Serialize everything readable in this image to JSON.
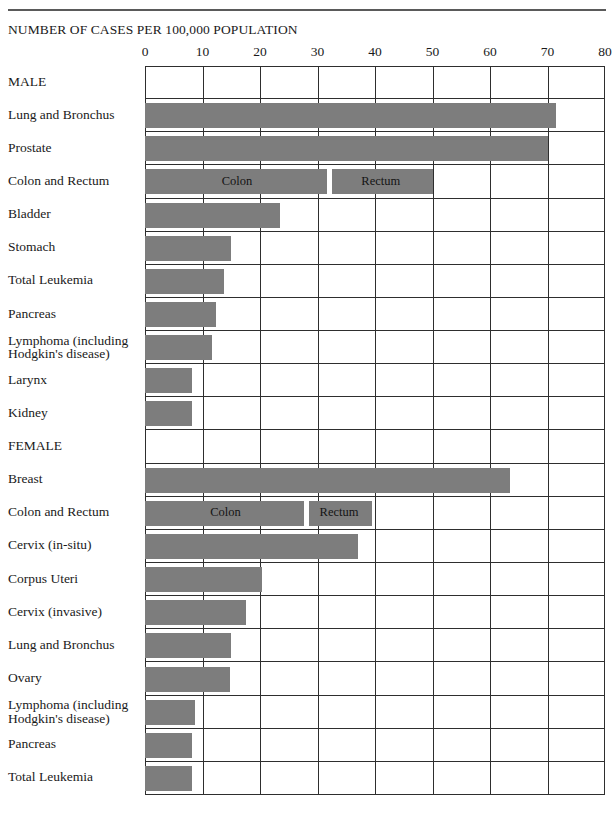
{
  "header": {
    "title": "NUMBER OF CASES PER 100,000 POPULATION"
  },
  "chart_data": {
    "type": "bar",
    "orientation": "horizontal",
    "title": "NUMBER OF CASES PER 100,000 POPULATION",
    "xlabel": "",
    "ylabel": "",
    "xlim": [
      0,
      80
    ],
    "xticks": [
      0,
      10,
      20,
      30,
      40,
      50,
      60,
      70,
      80
    ],
    "xtick_labels": [
      "0",
      "10",
      "20",
      "30",
      "40",
      "50",
      "60",
      "70",
      "80"
    ],
    "grid": true,
    "legend": "none",
    "bar_color": "#7d7d7d",
    "groups": [
      {
        "name": "MALE",
        "categories": [
          "Lung and Bronchus",
          "Prostate",
          "Colon and Rectum",
          "Bladder",
          "Stomach",
          "Total Leukemia",
          "Pancreas",
          "Lymphoma (including Hodgkin's disease)",
          "Larynx",
          "Kidney"
        ],
        "values": [
          71.5,
          70.0,
          50.0,
          23.5,
          15.0,
          13.7,
          12.3,
          11.7,
          8.2,
          8.2
        ],
        "stacked_rows": [
          {
            "category": "Colon and Rectum",
            "segments": [
              {
                "label": "Colon",
                "value": 32.0
              },
              {
                "label": "Rectum",
                "value": 18.0
              }
            ],
            "total": 50.0
          }
        ]
      },
      {
        "name": "FEMALE",
        "categories": [
          "Breast",
          "Colon and Rectum",
          "Cervix (in-situ)",
          "Corpus Uteri",
          "Cervix (invasive)",
          "Lung and Bronchus",
          "Ovary",
          "Lymphoma (including Hodgkin's disease)",
          "Pancreas",
          "Total Leukemia"
        ],
        "values": [
          63.5,
          39.5,
          37.0,
          20.4,
          17.5,
          15.0,
          14.8,
          8.7,
          8.2,
          8.2
        ],
        "stacked_rows": [
          {
            "category": "Colon and Rectum",
            "segments": [
              {
                "label": "Colon",
                "value": 28.0
              },
              {
                "label": "Rectum",
                "value": 11.5
              }
            ],
            "total": 39.5
          }
        ]
      }
    ],
    "annotations": [
      "Colon",
      "Rectum",
      "Colon",
      "Rectum"
    ]
  },
  "rows": [
    {
      "label": "MALE",
      "label2": "",
      "value": 0,
      "segments": []
    },
    {
      "label": "Lung and Bronchus",
      "label2": "",
      "value": 71.5,
      "segments": []
    },
    {
      "label": "Prostate",
      "label2": "",
      "value": 70.0,
      "segments": []
    },
    {
      "label": "Colon and Rectum",
      "label2": "",
      "value": 50.0,
      "segments": [
        {
          "label": "Colon",
          "end": 32.0
        },
        {
          "label": "Rectum",
          "end": 50.0
        }
      ]
    },
    {
      "label": "Bladder",
      "label2": "",
      "value": 23.5,
      "segments": []
    },
    {
      "label": "Stomach",
      "label2": "",
      "value": 15.0,
      "segments": []
    },
    {
      "label": "Total Leukemia",
      "label2": "",
      "value": 13.7,
      "segments": []
    },
    {
      "label": "Pancreas",
      "label2": "",
      "value": 12.3,
      "segments": []
    },
    {
      "label": "Lymphoma (including",
      "label2": "Hodgkin's disease)",
      "value": 11.7,
      "segments": []
    },
    {
      "label": "Larynx",
      "label2": "",
      "value": 8.2,
      "segments": []
    },
    {
      "label": "Kidney",
      "label2": "",
      "value": 8.2,
      "segments": []
    },
    {
      "label": "FEMALE",
      "label2": "",
      "value": 0,
      "segments": []
    },
    {
      "label": "Breast",
      "label2": "",
      "value": 63.5,
      "segments": []
    },
    {
      "label": "Colon and Rectum",
      "label2": "",
      "value": 39.5,
      "segments": [
        {
          "label": "Colon",
          "end": 28.0
        },
        {
          "label": "Rectum",
          "end": 39.5
        }
      ]
    },
    {
      "label": "Cervix (in-situ)",
      "label2": "",
      "value": 37.0,
      "segments": []
    },
    {
      "label": "Corpus Uteri",
      "label2": "",
      "value": 20.4,
      "segments": []
    },
    {
      "label": "Cervix (invasive)",
      "label2": "",
      "value": 17.5,
      "segments": []
    },
    {
      "label": "Lung and Bronchus",
      "label2": "",
      "value": 15.0,
      "segments": []
    },
    {
      "label": "Ovary",
      "label2": "",
      "value": 14.8,
      "segments": []
    },
    {
      "label": "Lymphoma (including",
      "label2": "Hodgkin's disease)",
      "value": 8.7,
      "segments": []
    },
    {
      "label": "Pancreas",
      "label2": "",
      "value": 8.2,
      "segments": []
    },
    {
      "label": "Total Leukemia",
      "label2": "",
      "value": 8.2,
      "segments": []
    }
  ]
}
